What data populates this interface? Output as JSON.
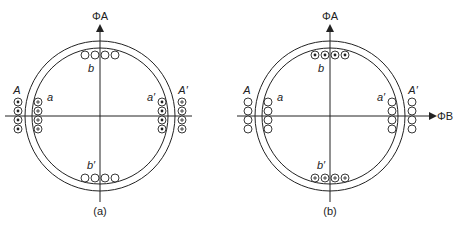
{
  "figure": {
    "panels": [
      {
        "id": "a",
        "caption": "(a)",
        "cx": 100,
        "axis_label_vertical": "ΦA",
        "axis_label_horizontal": "",
        "labels": {
          "A": "A",
          "a": "a",
          "a_prime": "a′",
          "A_prime": "A′",
          "b": "b",
          "b_prime": "b′"
        },
        "coils": {
          "A": "dot",
          "a": "cross",
          "a_prime": "dot",
          "A_prime": "cross",
          "b": "empty",
          "b_prime": "empty"
        }
      },
      {
        "id": "b",
        "caption": "(b)",
        "cx": 330,
        "axis_label_vertical": "ΦA",
        "axis_label_horizontal": "ΦB",
        "labels": {
          "A": "A",
          "a": "a",
          "a_prime": "a′",
          "A_prime": "A′",
          "b": "b",
          "b_prime": "b′"
        },
        "coils": {
          "A": "empty",
          "a": "empty",
          "a_prime": "empty",
          "A_prime": "empty",
          "b": "dot",
          "b_prime": "cross"
        }
      }
    ],
    "colors": {
      "stroke": "#222222",
      "background": "#ffffff"
    }
  }
}
